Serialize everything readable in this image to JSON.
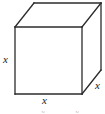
{
  "figure": {
    "name": "cube-diagram",
    "background_color": "#ffffff",
    "stroke_color": "#2b2b2b",
    "stroke_width": 1.3,
    "hidden_edge_style": "not drawn",
    "labels": {
      "left_edge": "x",
      "bottom_edge": "x",
      "right_depth_edge": "x"
    },
    "geometry": {
      "front_face": {
        "top_left": [
          15,
          27
        ],
        "top_right": [
          82,
          27
        ],
        "bottom_right": [
          82,
          94
        ],
        "bottom_left": [
          15,
          94
        ]
      },
      "depth_offset": [
        19,
        -24
      ],
      "back_face": {
        "top_left": [
          34,
          3
        ],
        "top_right": [
          101,
          3
        ],
        "bottom_right": [
          101,
          70
        ],
        "bottom_left": [
          34,
          70
        ]
      },
      "visible_faces": [
        "front",
        "top",
        "right"
      ]
    },
    "cut_fragments": {
      "left": "x",
      "right": "x"
    }
  }
}
